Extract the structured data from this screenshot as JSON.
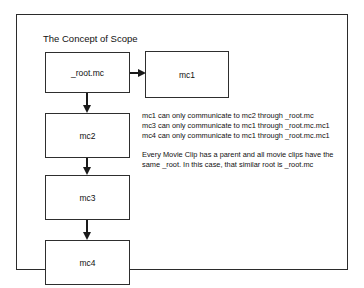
{
  "diagram": {
    "title": "The Concept of Scope",
    "type": "flowchart",
    "nodes": [
      {
        "id": "root",
        "label": "_root.mc"
      },
      {
        "id": "mc1",
        "label": "mc1"
      },
      {
        "id": "mc2",
        "label": "mc2"
      },
      {
        "id": "mc3",
        "label": "mc3"
      },
      {
        "id": "mc4",
        "label": "mc4"
      }
    ],
    "edges": [
      {
        "from": "root",
        "to": "mc1",
        "direction": "right"
      },
      {
        "from": "root",
        "to": "mc2",
        "direction": "down"
      },
      {
        "from": "mc2",
        "to": "mc3",
        "direction": "down"
      },
      {
        "from": "mc3",
        "to": "mc4",
        "direction": "down"
      }
    ],
    "annotations": {
      "rules": [
        "mc1 can only communicate to mc2 through _root.mc",
        "mc3 can only communicate to mc1 through _root.mc.mc1",
        "mc4 can only communicate to mc1 through _root.mc.mc1"
      ],
      "note_line_1": "Every Movie Clip has a parent and all movie clips have the",
      "note_line_2": "same _root. In this case, that similar root is _root.mc"
    }
  }
}
